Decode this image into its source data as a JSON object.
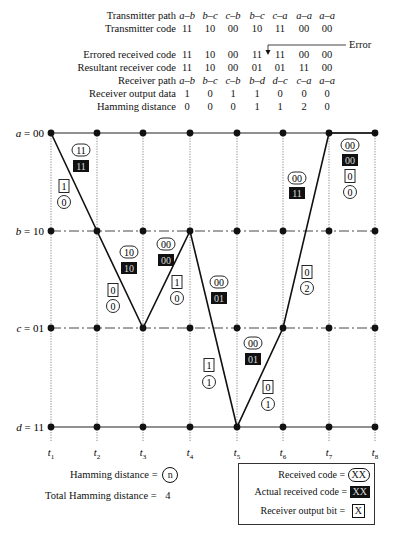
{
  "table": {
    "rows": [
      {
        "label": "Transmitter path",
        "italic": true,
        "values": [
          "a–b",
          "b–c",
          "c–b",
          "b–c",
          "c–a",
          "a–a",
          "a–a"
        ]
      },
      {
        "label": "Transmitter code",
        "italic": false,
        "values": [
          "11",
          "10",
          "00",
          "10",
          "11",
          "00",
          "00"
        ]
      },
      {
        "label": "Errored received code",
        "italic": false,
        "values": [
          "11",
          "10",
          "00",
          "11",
          "11",
          "00",
          "00"
        ]
      },
      {
        "label": "Resultant receiver code",
        "italic": false,
        "values": [
          "11",
          "10",
          "00",
          "01",
          "01",
          "11",
          "00"
        ]
      },
      {
        "label": "Receiver path",
        "italic": true,
        "values": [
          "a–b",
          "b–c",
          "c–b",
          "b–d",
          "d–c",
          "c–a",
          "a–a"
        ]
      },
      {
        "label": "Receiver output data",
        "italic": false,
        "values": [
          "1",
          "0",
          "1",
          "1",
          "0",
          "0",
          "0"
        ]
      },
      {
        "label": "Hamming distance",
        "italic": false,
        "values": [
          "0",
          "0",
          "0",
          "1",
          "1",
          "2",
          "0"
        ]
      }
    ],
    "error_label": "Error"
  },
  "trellis": {
    "states": [
      "a = 00",
      "b = 10",
      "c = 01",
      "d = 11"
    ],
    "times": [
      "t1",
      "t2",
      "t3",
      "t4",
      "t5",
      "t6",
      "t7",
      "t8"
    ],
    "path": [
      "a",
      "b",
      "c",
      "b",
      "d",
      "c",
      "a",
      "a"
    ],
    "segments": [
      {
        "received": "11",
        "actual": "11",
        "output_bit": "1",
        "hamming": "0"
      },
      {
        "received": "10",
        "actual": "10",
        "output_bit": "0",
        "hamming": "0"
      },
      {
        "received": "00",
        "actual": "00",
        "output_bit": "1",
        "hamming": "0"
      },
      {
        "received": "00",
        "actual": "01",
        "output_bit": "1",
        "hamming": "1"
      },
      {
        "received": "00",
        "actual": "01",
        "output_bit": "0",
        "hamming": "1"
      },
      {
        "received": "00",
        "actual": "11",
        "output_bit": "0",
        "hamming": "2"
      },
      {
        "received": "00",
        "actual": "00",
        "output_bit": "0",
        "hamming": "0"
      }
    ]
  },
  "footer": {
    "hamming_label": "Hamming distance =",
    "hamming_symbol": "n",
    "total_label": "Total Hamming distance =",
    "total_value": "4"
  },
  "legend": {
    "received_label": "Received code =",
    "received_symbol": "XX",
    "actual_label": "Actual received code =",
    "actual_symbol": "XX",
    "output_label": "Receiver output bit =",
    "output_symbol": "X"
  }
}
